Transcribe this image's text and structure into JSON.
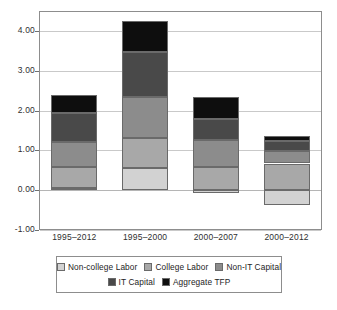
{
  "chart_data": {
    "type": "bar",
    "subtype": "stacked-bar",
    "title": "",
    "subtitle": "",
    "xlabel": "",
    "ylabel": "",
    "categories": [
      "1995–2012",
      "1995–2000",
      "2000–2007",
      "2000–2012"
    ],
    "ylim": [
      -1.0,
      4.5
    ],
    "yticks": [
      -1.0,
      0.0,
      1.0,
      2.0,
      3.0,
      4.0
    ],
    "ytick_labels": [
      "-1.00",
      "0.00",
      "1.00",
      "2.00",
      "3.00",
      "4.00"
    ],
    "grid": true,
    "legend_position": "bottom",
    "series": [
      {
        "name": "Non-college Labor",
        "color": "#d2d2d2",
        "values": [
          0.05,
          0.55,
          -0.07,
          -0.38
        ]
      },
      {
        "name": "College Labor",
        "color": "#a8a8a8",
        "values": [
          0.54,
          0.77,
          0.59,
          0.67
        ]
      },
      {
        "name": "Non-IT Capital",
        "color": "#8c8c8c",
        "values": [
          0.62,
          1.03,
          0.67,
          0.31
        ]
      },
      {
        "name": "IT Capital",
        "color": "#494949",
        "values": [
          0.74,
          1.13,
          0.54,
          0.26
        ]
      },
      {
        "name": "Aggregate TFP",
        "color": "#0e0e0e",
        "values": [
          0.44,
          0.77,
          0.54,
          0.13
        ]
      }
    ],
    "totals": [
      2.39,
      4.25,
      2.27,
      0.99
    ]
  },
  "legend": {
    "rows": [
      [
        {
          "label": "Non-college Labor",
          "color": "#d2d2d2"
        },
        {
          "label": "College Labor",
          "color": "#a8a8a8"
        },
        {
          "label": "Non-IT Capital",
          "color": "#8c8c8c"
        }
      ],
      [
        {
          "label": "IT Capital",
          "color": "#494949"
        },
        {
          "label": "Aggregate TFP",
          "color": "#0e0e0e"
        }
      ]
    ]
  },
  "colors": {
    "frame": "#8d8d8d",
    "grid": "#c9c9c9",
    "background": "#ffffff",
    "text": "#2f2f2f"
  }
}
